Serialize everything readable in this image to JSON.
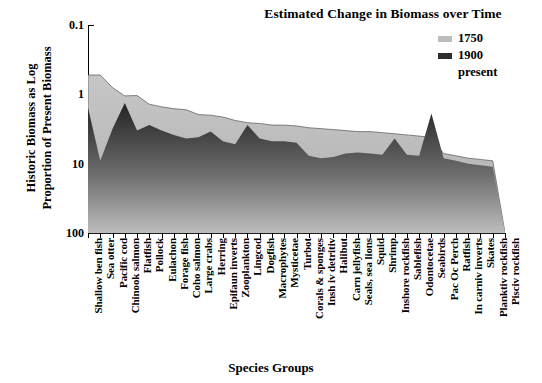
{
  "title": "Estimated Change in Biomass over Time",
  "axes": {
    "ylabel": "Historic Biomass as Log\nProportion of Present Biomass",
    "xlabel": "Species Groups",
    "yticks": [
      "100",
      "10",
      "1",
      "0.1"
    ]
  },
  "legend": {
    "entries": [
      {
        "label": "1750",
        "color": "#bdbdbd"
      },
      {
        "label": "1900",
        "color": "#2e2e2e"
      },
      {
        "label": "present",
        "color": "#ffffff"
      }
    ]
  },
  "colors": {
    "series_1750": "#b9b9b9",
    "series_1900": "#3a3a3a",
    "axis": "#000000",
    "background": "#ffffff"
  },
  "chart_data": {
    "type": "area",
    "title": "Estimated Change in Biomass over Time",
    "xlabel": "Species Groups",
    "ylabel": "Historic Biomass as Log Proportion of Present Biomass",
    "yscale": "log",
    "ylim": [
      0.1,
      100
    ],
    "yticks": [
      0.1,
      1,
      10,
      100
    ],
    "grid": false,
    "legend_position": "top-right",
    "categories": [
      "Shallow ben fish",
      "Sea otter",
      "Pacific cod",
      "Chinook salmon",
      "Flatfish",
      "Pollock",
      "Eulachon",
      "Forage fish",
      "Coho salmon",
      "Large crabs",
      "Herring",
      "Epifaun inverts",
      "Zooplankton",
      "Lingcod",
      "Dogfish",
      "Macrophytes",
      "Mysticetae",
      "Turbot",
      "Corals & sponges",
      "Insh iv detritiv",
      "Halibut",
      "Carn jellyfish",
      "Seals, sea lions",
      "Squid",
      "Shrimp",
      "Inshore rockfish",
      "Sablefish",
      "Odontocetae",
      "Seabirds",
      "Pac Oc Perch",
      "Ratfish",
      "In carniv inverts",
      "Skates",
      "Planktiv rockfish",
      "Pisciv rockfish"
    ],
    "series": [
      {
        "name": "1750",
        "color": "#b9b9b9",
        "values": [
          19.0,
          19.0,
          12.5,
          9.5,
          9.6,
          7.2,
          6.6,
          6.2,
          6.0,
          5.1,
          5.0,
          4.7,
          4.2,
          3.9,
          3.8,
          3.6,
          3.6,
          3.5,
          3.3,
          3.2,
          3.1,
          3.0,
          2.9,
          2.9,
          2.8,
          2.7,
          2.6,
          2.5,
          2.4,
          1.4,
          1.3,
          1.2,
          1.15,
          1.1,
          0.1
        ]
      },
      {
        "name": "1900",
        "color": "#3a3a3a",
        "values": [
          6.4,
          1.1,
          3.2,
          7.5,
          3.0,
          3.6,
          3.0,
          2.6,
          2.3,
          2.4,
          2.9,
          2.1,
          1.9,
          3.6,
          2.3,
          2.1,
          2.1,
          2.0,
          1.3,
          1.2,
          1.25,
          1.4,
          1.45,
          1.4,
          1.35,
          2.3,
          1.35,
          1.3,
          5.3,
          1.2,
          1.1,
          1.0,
          0.95,
          0.9,
          0.1
        ]
      },
      {
        "name": "present",
        "color": "#ffffff",
        "values": [
          1.0,
          1.0,
          1.0,
          1.0,
          1.0,
          1.0,
          1.0,
          1.0,
          1.0,
          1.0,
          1.0,
          1.0,
          1.0,
          1.0,
          1.0,
          1.0,
          1.0,
          1.0,
          1.0,
          1.0,
          1.0,
          1.0,
          1.0,
          1.0,
          1.0,
          1.0,
          1.0,
          1.0,
          1.0,
          1.0,
          1.0,
          1.0,
          1.0,
          1.0,
          1.0
        ]
      }
    ]
  }
}
